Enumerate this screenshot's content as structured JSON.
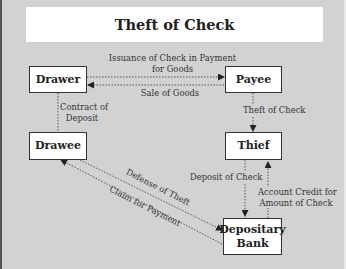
{
  "title": "Theft of Check",
  "nodes": {
    "drawer": "Drawer",
    "payee": "Payee",
    "drawee": "Drawee",
    "thief": "Thief",
    "depositary_bank_line1": "Depositary",
    "depositary_bank_line2": "Bank"
  },
  "edges": {
    "issuance_line1": "Issuance of Check in Payment",
    "issuance_line2": "for Goods",
    "sale_of_goods": "Sale of Goods",
    "contract_line1": "Contract of",
    "contract_line2": "Deposit",
    "theft_of_check": "Theft of Check",
    "deposit_of_check": "Deposit of Check",
    "account_credit_line1": "Account Credit for",
    "account_credit_line2": "Amount of Check",
    "defense_of_theft": "Defense of Theft",
    "claim_for_payment": "Claim for Payment"
  },
  "colors": {
    "background": "#d2d2d2",
    "box": "#ffffff",
    "line": "#444444"
  }
}
